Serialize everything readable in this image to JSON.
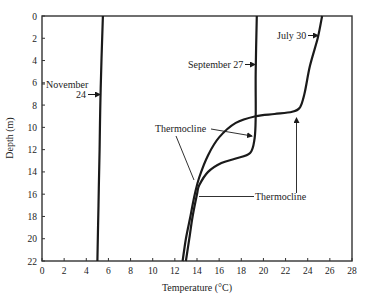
{
  "chart_data": {
    "type": "line",
    "title": "",
    "xlabel": "Temperature (°C)",
    "ylabel": "Depth (m)",
    "xlim": [
      0,
      28
    ],
    "ylim": [
      22,
      0
    ],
    "y_inverted": true,
    "grid": false,
    "legend": "none (curves labeled directly)",
    "x_ticks": [
      "0",
      "2",
      "4",
      "6",
      "8",
      "10",
      "12",
      "14",
      "16",
      "18",
      "20",
      "22",
      "24",
      "26",
      "28"
    ],
    "y_ticks": [
      "0",
      "2",
      "4",
      "6",
      "8",
      "10",
      "12",
      "14",
      "16",
      "18",
      "20",
      "22"
    ],
    "series": [
      {
        "name": "November 24",
        "points": [
          [
            5.5,
            0
          ],
          [
            5.3,
            6.5
          ],
          [
            5.2,
            12
          ],
          [
            5.1,
            17
          ],
          [
            5.0,
            22
          ]
        ]
      },
      {
        "name": "September 27",
        "points": [
          [
            19.4,
            0
          ],
          [
            19.3,
            5
          ],
          [
            19.3,
            9
          ],
          [
            19.2,
            11
          ],
          [
            18.8,
            12.3
          ],
          [
            17.5,
            12.8
          ],
          [
            16.2,
            13.2
          ],
          [
            15.0,
            14.0
          ],
          [
            14.2,
            15.2
          ],
          [
            14.0,
            16.0
          ],
          [
            13.6,
            18
          ],
          [
            13.3,
            20
          ],
          [
            13.0,
            22
          ]
        ]
      },
      {
        "name": "July 30",
        "points": [
          [
            25.3,
            0
          ],
          [
            24.9,
            2
          ],
          [
            24.2,
            4.5
          ],
          [
            23.7,
            7
          ],
          [
            23.3,
            8.2
          ],
          [
            22.6,
            8.6
          ],
          [
            21.0,
            8.8
          ],
          [
            19.3,
            9.0
          ],
          [
            17.5,
            9.6
          ],
          [
            16.0,
            10.9
          ],
          [
            15.0,
            12.5
          ],
          [
            14.2,
            14.5
          ],
          [
            13.8,
            16
          ],
          [
            13.4,
            18
          ],
          [
            13.0,
            20
          ],
          [
            12.7,
            22
          ]
        ]
      }
    ],
    "annotations": [
      {
        "text": "November",
        "x": 0.3,
        "y": 6.2
      },
      {
        "text": "24",
        "x": 3.8,
        "y": 6.8,
        "arrow_to": [
          5.3,
          6.8
        ]
      },
      {
        "text": "September 27",
        "x": 13.5,
        "y": 4.3,
        "arrow_to": [
          19.3,
          4.3
        ]
      },
      {
        "text": "July 30",
        "x": 21.2,
        "y": 1.8,
        "arrow_to": [
          24.9,
          1.8
        ]
      },
      {
        "text": "Thermocline",
        "x": 10,
        "y": 10.2,
        "arrows_to": [
          [
            18.9,
            11
          ],
          [
            13.9,
            14.9
          ]
        ]
      },
      {
        "text": "Thermocline",
        "x": 19.2,
        "y": 16.2,
        "arrows_to": [
          [
            14.1,
            16.2
          ],
          [
            22.9,
            9.0
          ]
        ]
      }
    ]
  },
  "labels": {
    "xlabel": "Temperature (°C)",
    "ylabel": "Depth (m)",
    "nov_line1": "November",
    "nov_line2": "24",
    "sep": "September 27",
    "jul": "July 30",
    "thermo1": "Thermocline",
    "thermo2": "Thermocline"
  },
  "colors": {
    "ink": "#1a1a1a",
    "background": "#ffffff"
  }
}
